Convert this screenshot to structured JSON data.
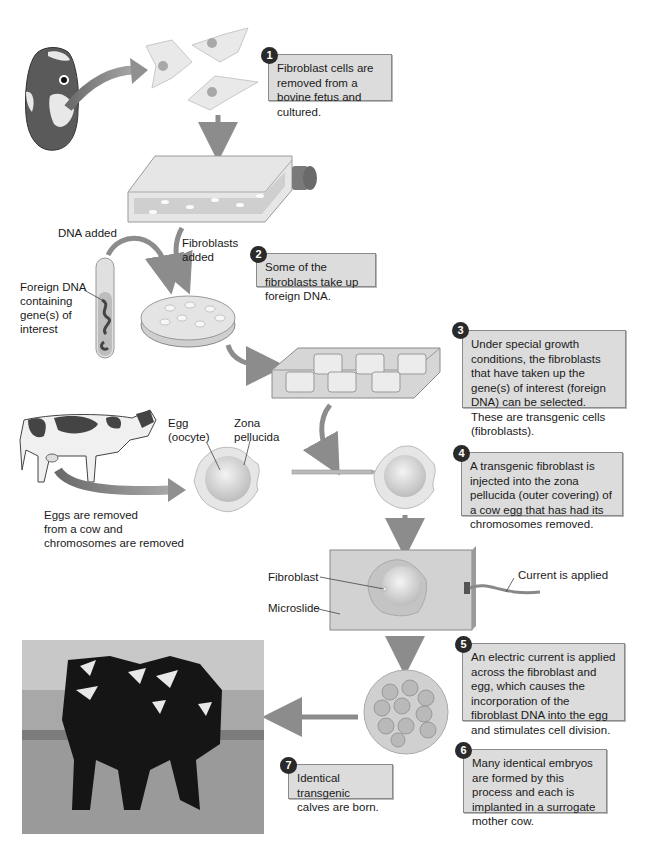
{
  "steps": [
    {
      "num": "1",
      "text": "Fibroblast cells are removed from a bovine fetus and cultured."
    },
    {
      "num": "2",
      "text": "Some of the fibroblasts take up foreign DNA."
    },
    {
      "num": "3",
      "text": "Under special growth conditions, the fibroblasts that have taken up the gene(s) of interest (foreign DNA) can be selected. These are transgenic cells (fibroblasts)."
    },
    {
      "num": "4",
      "text": "A transgenic fibroblast is injected into the zona pellucida (outer covering) of a cow egg that has had its chromosomes removed."
    },
    {
      "num": "5",
      "text": "An electric current is applied across the fibroblast and egg, which causes the incorporation of the fibroblast DNA into the egg and stimulates cell division."
    },
    {
      "num": "6",
      "text": "Many identical embryos are formed by this process and each is implanted in a surrogate mother cow."
    },
    {
      "num": "7",
      "text": "Identical transgenic calves are born."
    }
  ],
  "labels": {
    "dna_added": "DNA added",
    "fibroblasts_added_1": "Fibroblasts",
    "fibroblasts_added_2": "added",
    "foreign_dna_1": "Foreign DNA",
    "foreign_dna_2": "containing",
    "foreign_dna_3": "gene(s) of",
    "foreign_dna_4": "interest",
    "egg_1": "Egg",
    "egg_2": "(oocyte)",
    "zona_1": "Zona",
    "zona_2": "pellucida",
    "eggs_removed_1": "Eggs are removed",
    "eggs_removed_2": "from a cow and",
    "eggs_removed_3": "chromosomes are removed",
    "fibroblast": "Fibroblast",
    "microslide": "Microslide",
    "current": "Current is applied"
  },
  "colors": {
    "box_fill": "#dcdcdc",
    "box_border": "#8a8a8a",
    "badge": "#2a2a2a",
    "arrow": "#8c8c8c"
  }
}
